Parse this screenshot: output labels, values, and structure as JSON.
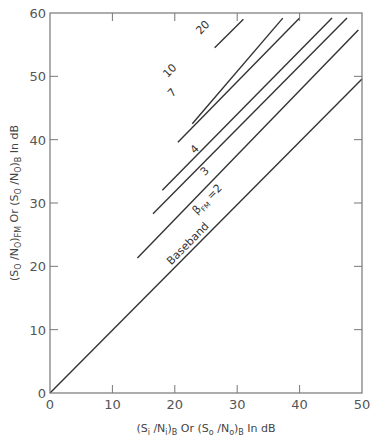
{
  "chart_data": {
    "type": "line",
    "title": "",
    "xlabel": "(Si/Ni)B Or (So/No)B In dB",
    "ylabel": "(So/No)FM Or (So/No)B In dB",
    "xlim": [
      0,
      50
    ],
    "ylim": [
      0,
      60
    ],
    "x_ticks": [
      0,
      10,
      20,
      30,
      40,
      50
    ],
    "y_ticks": [
      0,
      10,
      20,
      30,
      40,
      50,
      60
    ],
    "grid": false,
    "legend": "none (inline curve labels)",
    "series": [
      {
        "name": "Baseband",
        "label": "Baseband",
        "x": [
          0,
          50
        ],
        "y": [
          0,
          49.6
        ]
      },
      {
        "name": "βFM = 2",
        "label": "βFM = 2",
        "x": [
          14,
          49.4
        ],
        "y": [
          21.3,
          57.3
        ]
      },
      {
        "name": "βFM = 3",
        "label": "3",
        "x": [
          16.5,
          47.6
        ],
        "y": [
          28.3,
          59.2
        ]
      },
      {
        "name": "βFM = 4",
        "label": "4",
        "x": [
          18,
          45.2
        ],
        "y": [
          32,
          59.2
        ]
      },
      {
        "name": "βFM = 7",
        "label": "7",
        "x": [
          20.5,
          40
        ],
        "y": [
          39.6,
          59.2
        ]
      },
      {
        "name": "βFM = 10",
        "label": "10",
        "x": [
          22.8,
          37.3
        ],
        "y": [
          42.5,
          59.2
        ]
      },
      {
        "name": "βFM = 20",
        "label": "20",
        "x": [
          26.4,
          31
        ],
        "y": [
          54.5,
          59
        ]
      }
    ]
  },
  "labels": {
    "xlabel_parts": {
      "a": "(S",
      "a_sub": "i",
      "b": " /N",
      "b_sub": "i",
      "c": ")",
      "c_sub": "B",
      "d": "  Or  (S",
      "d_sub": "o",
      "e": " /N",
      "e_sub": "o",
      "f": ")",
      "f_sub": "B",
      "g": "  In  dB"
    },
    "ylabel_parts": {
      "a": "(S",
      "a_sub": "O",
      "b": " /N",
      "b_sub": "O",
      "c": ")",
      "c_sub": "FM",
      "d": "  Or  (S",
      "d_sub": "O",
      "e": " /N",
      "e_sub": "O",
      "f": ")",
      "f_sub": "B",
      "g": "  In  dB"
    },
    "beta_prefix": "β",
    "beta_sub": "FM",
    "beta_suffix": " =2"
  }
}
